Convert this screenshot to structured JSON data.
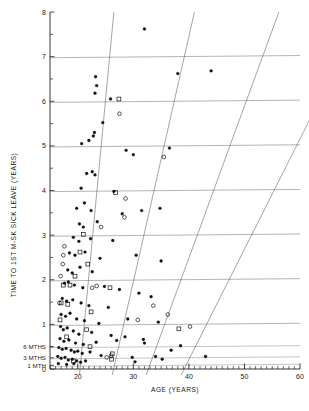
{
  "chart_data": {
    "type": "scatter",
    "title": "",
    "xlabel": "AGE (YEARS)",
    "ylabel": "TIME TO 1ST M-SK SICK LEAVE (YEARS)",
    "xlim": [
      15,
      60
    ],
    "ylim": [
      0,
      8
    ],
    "grid": true,
    "legend_position": "none",
    "xticks": [
      20,
      30,
      40,
      50,
      60
    ],
    "xtick_labels": [
      "20",
      "30",
      "40",
      "50",
      "60"
    ],
    "xminor_step": 1,
    "yticks": [
      0,
      1,
      2,
      3,
      4,
      5,
      6,
      7,
      8
    ],
    "ytick_labels": [
      "0",
      "1",
      "2",
      "3",
      "4",
      "5",
      "6",
      "7",
      "8"
    ],
    "yminor_ticks": [
      0.5,
      1.5,
      2.5,
      3.5,
      4.5,
      5.5,
      6.5,
      7.5
    ],
    "y_special_labels": [
      {
        "value": 0.5,
        "label": "6 MTHS"
      },
      {
        "value": 0.25,
        "label": "3 MTHS"
      },
      {
        "value": 0.083,
        "label": "1 MTH"
      }
    ],
    "gridlines_y": [
      1,
      2,
      3,
      4,
      5,
      6,
      7
    ],
    "diagonal_lines": {
      "count": 4,
      "description": "cohort lines slanting down to the right",
      "x_at_top": [
        26.5,
        41.0,
        56.2,
        71.5
      ],
      "x_at_bottom": [
        20.3,
        26.2,
        32.3,
        38.6
      ]
    },
    "series": [
      {
        "name": "filled-circle",
        "marker": "filled-circle",
        "color": "#111111",
        "points": [
          [
            32.0,
            7.62
          ],
          [
            23.2,
            6.55
          ],
          [
            23.4,
            6.35
          ],
          [
            23.1,
            6.18
          ],
          [
            38.0,
            6.62
          ],
          [
            44.0,
            6.68
          ],
          [
            25.9,
            6.05
          ],
          [
            24.5,
            5.52
          ],
          [
            22.8,
            5.22
          ],
          [
            22.0,
            5.12
          ],
          [
            23.0,
            5.3
          ],
          [
            20.7,
            5.05
          ],
          [
            28.7,
            4.9
          ],
          [
            30.0,
            4.8
          ],
          [
            36.5,
            4.95
          ],
          [
            23.1,
            4.35
          ],
          [
            22.6,
            4.42
          ],
          [
            21.6,
            4.38
          ],
          [
            20.6,
            4.05
          ],
          [
            26.5,
            3.98
          ],
          [
            19.8,
            3.6
          ],
          [
            21.2,
            3.72
          ],
          [
            22.4,
            3.55
          ],
          [
            28.0,
            3.48
          ],
          [
            31.5,
            3.55
          ],
          [
            34.8,
            3.6
          ],
          [
            20.3,
            3.25
          ],
          [
            21.0,
            3.18
          ],
          [
            23.5,
            3.3
          ],
          [
            19.2,
            2.95
          ],
          [
            20.2,
            2.86
          ],
          [
            22.3,
            2.92
          ],
          [
            26.3,
            2.88
          ],
          [
            18.5,
            2.6
          ],
          [
            19.5,
            2.55
          ],
          [
            21.3,
            2.62
          ],
          [
            24.0,
            2.48
          ],
          [
            30.5,
            2.55
          ],
          [
            35.0,
            2.42
          ],
          [
            18.2,
            2.22
          ],
          [
            19.0,
            2.15
          ],
          [
            20.4,
            2.28
          ],
          [
            22.6,
            2.18
          ],
          [
            17.6,
            1.92
          ],
          [
            18.3,
            1.95
          ],
          [
            19.4,
            1.88
          ],
          [
            20.9,
            1.82
          ],
          [
            24.8,
            1.85
          ],
          [
            27.5,
            1.78
          ],
          [
            31.0,
            1.7
          ],
          [
            33.2,
            1.62
          ],
          [
            17.2,
            1.58
          ],
          [
            18.0,
            1.52
          ],
          [
            19.1,
            1.55
          ],
          [
            20.6,
            1.48
          ],
          [
            22.0,
            1.42
          ],
          [
            25.5,
            1.38
          ],
          [
            17.0,
            1.22
          ],
          [
            17.8,
            1.18
          ],
          [
            18.6,
            1.25
          ],
          [
            19.8,
            1.12
          ],
          [
            21.2,
            1.08
          ],
          [
            23.8,
            1.02
          ],
          [
            29.0,
            1.12
          ],
          [
            34.5,
            1.05
          ],
          [
            16.9,
            0.95
          ],
          [
            17.4,
            0.88
          ],
          [
            18.1,
            0.92
          ],
          [
            19.2,
            0.85
          ],
          [
            20.2,
            0.78
          ],
          [
            22.5,
            0.82
          ],
          [
            26.0,
            0.75
          ],
          [
            28.5,
            0.72
          ],
          [
            16.8,
            0.68
          ],
          [
            17.5,
            0.62
          ],
          [
            18.4,
            0.65
          ],
          [
            19.6,
            0.58
          ],
          [
            21.0,
            0.55
          ],
          [
            23.3,
            0.6
          ],
          [
            27.0,
            0.64
          ],
          [
            31.8,
            0.66
          ],
          [
            32.0,
            0.58
          ],
          [
            38.5,
            0.52
          ],
          [
            16.6,
            0.48
          ],
          [
            17.2,
            0.44
          ],
          [
            17.9,
            0.46
          ],
          [
            18.8,
            0.42
          ],
          [
            19.4,
            0.38
          ],
          [
            20.0,
            0.4
          ],
          [
            20.8,
            0.35
          ],
          [
            22.2,
            0.38
          ],
          [
            24.2,
            0.3
          ],
          [
            29.8,
            0.26
          ],
          [
            34.0,
            0.28
          ],
          [
            35.2,
            0.22
          ],
          [
            43.0,
            0.28
          ],
          [
            36.8,
            0.42
          ],
          [
            16.4,
            0.28
          ],
          [
            17.0,
            0.24
          ],
          [
            17.7,
            0.26
          ],
          [
            18.3,
            0.2
          ],
          [
            19.0,
            0.22
          ],
          [
            19.8,
            0.18
          ],
          [
            20.5,
            0.15
          ],
          [
            21.4,
            0.18
          ],
          [
            16.5,
            0.12
          ],
          [
            18.0,
            0.1
          ],
          [
            19.3,
            0.12
          ],
          [
            30.3,
            0.16
          ]
        ]
      },
      {
        "name": "open-square",
        "marker": "open-square",
        "color": "#111111",
        "points": [
          [
            27.4,
            6.05
          ],
          [
            26.8,
            3.95
          ],
          [
            21.0,
            3.02
          ],
          [
            20.4,
            2.62
          ],
          [
            21.8,
            2.35
          ],
          [
            19.5,
            2.08
          ],
          [
            17.4,
            1.88
          ],
          [
            18.6,
            1.88
          ],
          [
            25.8,
            1.82
          ],
          [
            17.0,
            1.48
          ],
          [
            18.2,
            1.45
          ],
          [
            22.4,
            1.28
          ],
          [
            16.8,
            1.1
          ],
          [
            21.6,
            0.88
          ],
          [
            38.2,
            0.9
          ],
          [
            18.0,
            0.72
          ],
          [
            22.2,
            0.5
          ],
          [
            26.2,
            0.34
          ],
          [
            26.1,
            0.22
          ],
          [
            19.2,
            0.18
          ]
        ]
      },
      {
        "name": "open-circle",
        "marker": "open-circle",
        "color": "#111111",
        "points": [
          [
            27.5,
            5.72
          ],
          [
            35.5,
            4.75
          ],
          [
            28.6,
            3.82
          ],
          [
            28.4,
            3.4
          ],
          [
            24.2,
            3.18
          ],
          [
            17.6,
            2.75
          ],
          [
            17.4,
            2.55
          ],
          [
            17.3,
            2.35
          ],
          [
            16.9,
            2.08
          ],
          [
            22.6,
            1.82
          ],
          [
            23.4,
            1.86
          ],
          [
            16.7,
            1.48
          ],
          [
            33.6,
            1.42
          ],
          [
            36.2,
            1.22
          ],
          [
            30.8,
            1.1
          ],
          [
            40.2,
            0.95
          ],
          [
            26.0,
            0.3
          ],
          [
            25.2,
            0.26
          ]
        ]
      }
    ]
  },
  "labels": {
    "faint_header_left": "",
    "faint_header_right": ""
  }
}
